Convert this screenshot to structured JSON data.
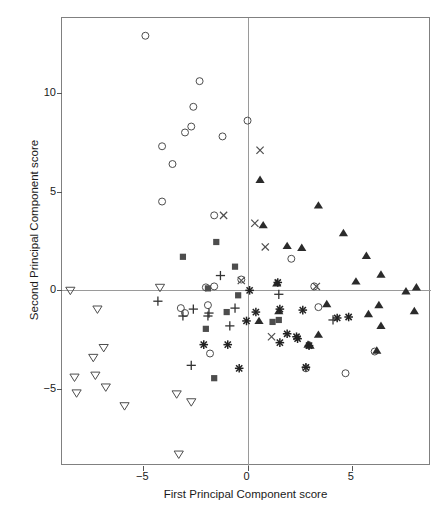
{
  "chart_data": {
    "type": "scatter",
    "title": "",
    "xlabel": "First Principal Component score",
    "ylabel": "Second Principal Component score",
    "xlim": [
      -8.9,
      8.8
    ],
    "ylim": [
      -8.9,
      13.8
    ],
    "xticks": [
      -5,
      0,
      5
    ],
    "xtick_labels": [
      "−5",
      "0",
      "5"
    ],
    "yticks": [
      10,
      5,
      0,
      -5
    ],
    "ytick_labels": [
      "10",
      "5",
      "0",
      "−5"
    ],
    "grid": false,
    "legend": "none",
    "reference_lines": {
      "horizontal": 0,
      "vertical": 0,
      "color": "#9a9a9a"
    },
    "marker_colors": {
      "open-circle": "#4d4d4d",
      "open-down-triangle": "#4d4d4d",
      "filled-square": "#4d4d4d",
      "filled-up-triangle": "#2b2b2b",
      "plus": "#333333",
      "cross": "#4d4d4d",
      "asterisk": "#222222"
    },
    "series": [
      {
        "name": "open-circle",
        "marker": "open-circle",
        "points": [
          [
            -4.9,
            12.9
          ],
          [
            -2.3,
            10.6
          ],
          [
            -2.6,
            9.3
          ],
          [
            -3.0,
            8.0
          ],
          [
            -2.7,
            8.3
          ],
          [
            -1.2,
            7.8
          ],
          [
            0.0,
            8.6
          ],
          [
            -4.1,
            7.3
          ],
          [
            -3.6,
            6.4
          ],
          [
            -4.1,
            4.5
          ],
          [
            -1.6,
            3.8
          ],
          [
            2.1,
            1.6
          ],
          [
            -2.0,
            0.15
          ],
          [
            -1.6,
            0.2
          ],
          [
            -0.3,
            0.55
          ],
          [
            3.2,
            0.2
          ],
          [
            -3.2,
            -0.9
          ],
          [
            -3.0,
            -1.15
          ],
          [
            -1.9,
            -0.75
          ],
          [
            3.4,
            -0.85
          ],
          [
            -1.8,
            -3.2
          ],
          [
            2.8,
            -3.95
          ],
          [
            4.7,
            -4.2
          ],
          [
            6.1,
            -3.1
          ]
        ]
      },
      {
        "name": "open-down-triangle",
        "marker": "open-down-triangle",
        "points": [
          [
            -8.5,
            0.0
          ],
          [
            -4.2,
            0.15
          ],
          [
            -7.2,
            -0.95
          ],
          [
            -6.9,
            -2.9
          ],
          [
            -7.4,
            -3.4
          ],
          [
            -8.3,
            -4.4
          ],
          [
            -7.3,
            -4.3
          ],
          [
            -8.2,
            -5.2
          ],
          [
            -6.8,
            -4.9
          ],
          [
            -5.9,
            -5.85
          ],
          [
            -3.4,
            -5.25
          ],
          [
            -2.7,
            -5.65
          ],
          [
            -3.3,
            -8.3
          ]
        ]
      },
      {
        "name": "filled-square",
        "marker": "filled-square",
        "points": [
          [
            -1.5,
            2.45
          ],
          [
            -3.1,
            1.7
          ],
          [
            -0.6,
            1.2
          ],
          [
            -0.45,
            -0.25
          ],
          [
            -1.9,
            0.1
          ],
          [
            -1.0,
            -1.1
          ],
          [
            -2.0,
            -1.95
          ],
          [
            1.2,
            -1.6
          ],
          [
            1.5,
            -1.5
          ],
          [
            -1.6,
            -4.45
          ]
        ]
      },
      {
        "name": "filled-up-triangle",
        "marker": "filled-up-triangle",
        "points": [
          [
            0.6,
            5.6
          ],
          [
            3.4,
            4.3
          ],
          [
            0.75,
            3.3
          ],
          [
            4.6,
            2.9
          ],
          [
            1.9,
            2.25
          ],
          [
            2.6,
            2.15
          ],
          [
            5.7,
            1.75
          ],
          [
            6.4,
            0.8
          ],
          [
            5.2,
            0.45
          ],
          [
            8.1,
            0.15
          ],
          [
            7.6,
            -0.05
          ],
          [
            1.4,
            0.35
          ],
          [
            1.5,
            -1.05
          ],
          [
            0.55,
            -1.55
          ],
          [
            3.8,
            -0.7
          ],
          [
            6.3,
            -0.75
          ],
          [
            5.8,
            -1.2
          ],
          [
            8.0,
            -1.05
          ],
          [
            3.4,
            -2.25
          ],
          [
            2.9,
            -2.75
          ],
          [
            6.4,
            -1.8
          ],
          [
            6.2,
            -3.05
          ],
          [
            3.0,
            -2.8
          ]
        ]
      },
      {
        "name": "plus",
        "marker": "plus",
        "points": [
          [
            -1.3,
            0.75
          ],
          [
            -4.3,
            -0.55
          ],
          [
            -3.1,
            -1.3
          ],
          [
            -2.6,
            -0.95
          ],
          [
            -1.9,
            -1.3
          ],
          [
            -1.85,
            -1.15
          ],
          [
            -0.85,
            -1.8
          ],
          [
            -0.6,
            -0.9
          ],
          [
            1.5,
            -0.2
          ],
          [
            4.1,
            -1.5
          ],
          [
            -2.7,
            -3.8
          ]
        ]
      },
      {
        "name": "cross",
        "marker": "cross",
        "points": [
          [
            0.6,
            7.1
          ],
          [
            -1.15,
            3.8
          ],
          [
            0.35,
            3.4
          ],
          [
            0.85,
            2.2
          ],
          [
            -0.3,
            0.5
          ],
          [
            3.3,
            0.2
          ],
          [
            1.15,
            -2.35
          ]
        ]
      },
      {
        "name": "asterisk",
        "marker": "asterisk",
        "points": [
          [
            0.1,
            0.0
          ],
          [
            1.45,
            0.4
          ],
          [
            0.4,
            -1.1
          ],
          [
            1.55,
            -0.95
          ],
          [
            -0.05,
            -1.55
          ],
          [
            2.65,
            -1.0
          ],
          [
            4.3,
            -1.4
          ],
          [
            1.9,
            -2.2
          ],
          [
            2.35,
            -2.35
          ],
          [
            2.4,
            -2.45
          ],
          [
            -2.1,
            -2.75
          ],
          [
            -0.95,
            -2.75
          ],
          [
            1.55,
            -2.65
          ],
          [
            2.8,
            -3.9
          ],
          [
            -0.4,
            -3.95
          ],
          [
            2.95,
            -2.8
          ],
          [
            4.85,
            -1.35
          ]
        ]
      }
    ]
  },
  "axes": {
    "x_title": "First Principal Component score",
    "y_title": "Second Principal Component score",
    "x_tick_labels": [
      "−5",
      "0",
      "5"
    ],
    "y_tick_labels": [
      "10",
      "5",
      "0",
      "−5"
    ]
  }
}
